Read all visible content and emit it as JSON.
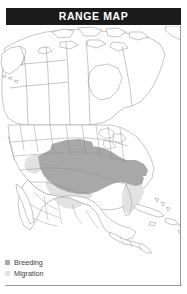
{
  "header": {
    "title": "RANGE MAP",
    "bar_color": "#1b1b1b",
    "text_color": "#ffffff"
  },
  "map": {
    "region": "North America",
    "outline_color": "#8c8c8c",
    "background_color": "#ffffff",
    "breeding_color": "#a8a8a8",
    "migration_color": "#dcdcdc"
  },
  "legend": {
    "items": [
      {
        "label": "Breeding",
        "color": "#a8a8a8",
        "icon": "square-swatch-icon"
      },
      {
        "label": "Migration",
        "color": "#e2e2e2",
        "icon": "square-swatch-icon"
      }
    ]
  }
}
